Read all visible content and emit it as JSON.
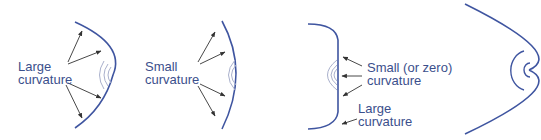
{
  "colors": {
    "curve": "#3f55a0",
    "faint_arc": "#a9b0cc",
    "arrow": "#333333",
    "label": "#3b4f8c"
  },
  "panels": [
    {
      "id": "panel-1",
      "label_lines": [
        "Large",
        "curvature"
      ],
      "description": "Convex surface with large curvature; arrows point outward to the curve"
    },
    {
      "id": "panel-2",
      "label_lines": [
        "Small",
        "curvature"
      ],
      "description": "Convex surface with small curvature; arrows point outward to the curve"
    },
    {
      "id": "panel-3",
      "labels": [
        {
          "lines": [
            "Small (or zero)",
            "curvature"
          ]
        },
        {
          "lines": [
            "Large",
            "curvature"
          ]
        }
      ],
      "description": "Flattened surface with small (or zero) curvature in middle and large curvature at corners"
    },
    {
      "id": "panel-4",
      "description": "Parabolic surface with osculating circles near the vertex"
    }
  ]
}
